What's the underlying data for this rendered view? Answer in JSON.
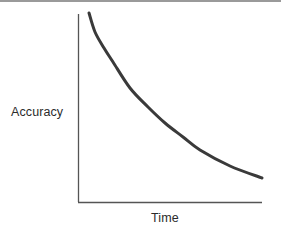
{
  "figure": {
    "background_color": "#ffffff",
    "top_rule_color": "#9a9a9a"
  },
  "chart_data": {
    "type": "line",
    "title": "",
    "subtitle": "",
    "xlabel": "Time",
    "ylabel": "Accuracy",
    "xtick_labels": [],
    "ytick_labels": [],
    "grid": false,
    "legend": [],
    "legend_position": "none",
    "annotations": [],
    "axis_style": {
      "spines": [
        "left",
        "bottom"
      ],
      "color": "#555555",
      "width_px": 1.3,
      "ticks": "none"
    },
    "xlim": [
      0,
      1
    ],
    "ylim": [
      0,
      1
    ],
    "series": [
      {
        "name": "accuracy-decay",
        "color": "#3a3a3a",
        "line_width_px": 3,
        "description": "monotonically decreasing convex curve (exponential decay)",
        "x": [
          0.0,
          0.04,
          0.1,
          0.18,
          0.28,
          0.4,
          0.52,
          0.63,
          0.75,
          0.87,
          1.0
        ],
        "y": [
          1.0,
          0.9,
          0.74,
          0.6,
          0.49,
          0.4,
          0.32,
          0.26,
          0.21,
          0.16,
          0.13
        ],
        "pixel_points": [
          [
            89,
            13
          ],
          [
            95,
            32
          ],
          [
            104,
            48
          ],
          [
            113,
            62
          ],
          [
            130,
            88
          ],
          [
            148,
            107
          ],
          [
            165,
            123
          ],
          [
            183,
            137
          ],
          [
            200,
            150
          ],
          [
            230,
            166
          ],
          [
            262,
            178
          ]
        ]
      }
    ],
    "plot_box_px": {
      "x_axis_y": 202,
      "y_axis_x": 78,
      "x_axis_left": 78,
      "x_axis_right": 262,
      "y_axis_top": 14,
      "y_axis_bottom": 202
    }
  },
  "labels": {
    "y_axis": "Accuracy",
    "x_axis": "Time"
  }
}
